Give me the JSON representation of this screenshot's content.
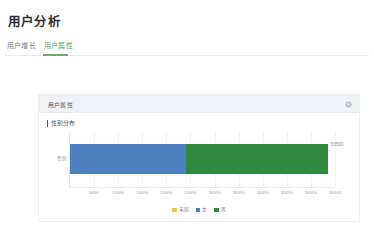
{
  "header": {
    "title": "用户分析"
  },
  "tabs": [
    {
      "label": "用户增长",
      "active": false
    },
    {
      "label": "用户属性",
      "active": true
    }
  ],
  "card": {
    "title": "用户属性",
    "settings_icon": "gear-icon"
  },
  "chart_data": {
    "type": "bar",
    "orientation": "horizontal",
    "stacked": true,
    "title": "性别分布",
    "xlabel": "",
    "ylabel": "",
    "categories": [
      "性别"
    ],
    "category_tick_label": "性别",
    "series": [
      {
        "name": "未知",
        "color": "#e8c74d",
        "values": [
          0
        ]
      },
      {
        "name": "女",
        "color": "#4e7fc1",
        "values": [
          24000
        ]
      },
      {
        "name": "男",
        "color": "#2f8a3e",
        "values": [
          29500
        ]
      }
    ],
    "total_label": "53500",
    "xlim": [
      0,
      55000
    ],
    "xticks": [
      5000,
      10000,
      15000,
      20000,
      25000,
      30000,
      35000,
      40000,
      45000,
      50000,
      55000
    ],
    "xtick_labels": [
      "5000",
      "10000",
      "15000",
      "20000",
      "25000",
      "30000",
      "35000",
      "40000",
      "45000",
      "50000",
      "55000"
    ],
    "grid": true,
    "legend_position": "bottom"
  },
  "colors": {
    "accent_green": "#6aab6e",
    "bar_female": "#4e7fc1",
    "bar_male": "#2f8a3e",
    "bar_unknown": "#e8c74d",
    "card_header_bg": "#eef1f5",
    "text_primary": "#2d3034",
    "text_muted": "#8a9096"
  }
}
